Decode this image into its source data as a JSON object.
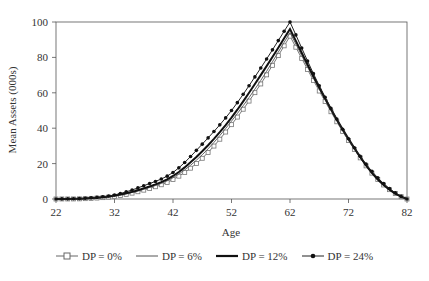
{
  "chart_data": {
    "type": "line",
    "title": "",
    "xlabel": "Age",
    "ylabel": "Mean Assets (000s)",
    "xlim": [
      22,
      82
    ],
    "ylim": [
      0,
      100
    ],
    "x_ticks": [
      22,
      32,
      42,
      52,
      62,
      72,
      82
    ],
    "y_ticks": [
      0,
      20,
      40,
      60,
      80,
      100
    ],
    "grid": false,
    "frame": true,
    "legend_position": "bottom",
    "x": [
      22,
      27,
      32,
      37,
      42,
      47,
      52,
      57,
      62,
      67,
      72,
      77,
      82
    ],
    "series": [
      {
        "name": "DP = 0%",
        "marker": "open-square",
        "line": "thin",
        "values": [
          0,
          0.2,
          1.5,
          5,
          11,
          23,
          42,
          65,
          92,
          61,
          33,
          11,
          0
        ]
      },
      {
        "name": "DP = 6%",
        "marker": "none",
        "line": "thin",
        "values": [
          0,
          0.2,
          1.7,
          5.5,
          12,
          25,
          44,
          67,
          94,
          62,
          33,
          11,
          0
        ]
      },
      {
        "name": "DP = 12%",
        "marker": "none",
        "line": "thick",
        "values": [
          0,
          0.3,
          1.9,
          6,
          13,
          27,
          46,
          70,
          96,
          63,
          34,
          11,
          0
        ]
      },
      {
        "name": "DP = 24%",
        "marker": "filled-dot",
        "line": "thin",
        "values": [
          0,
          0.4,
          2.3,
          7.5,
          15,
          31,
          50,
          74,
          100,
          64,
          34,
          12,
          0
        ]
      }
    ]
  },
  "legend": [
    {
      "label": "DP = 0%"
    },
    {
      "label": "DP = 6%"
    },
    {
      "label": "DP = 12%"
    },
    {
      "label": "DP = 24%"
    }
  ]
}
